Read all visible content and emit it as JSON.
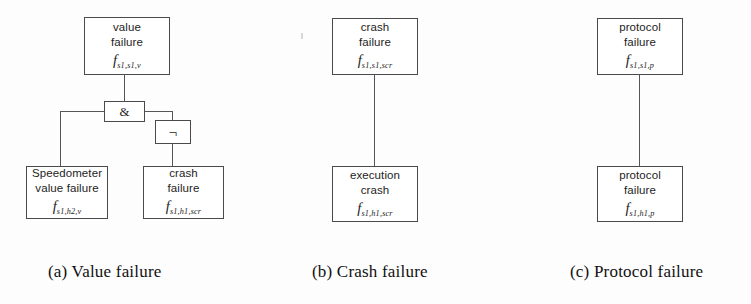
{
  "figure": {
    "kind": "fault-tree-diagram",
    "panel_count": 3,
    "colors": {
      "background": "#fdfdfd",
      "box_border": "#4a4a4a",
      "edge": "#55555a",
      "text": "#1d1d1d",
      "caption_text": "#111111"
    }
  },
  "panels": [
    {
      "id": "a",
      "caption": "(a) Value failure",
      "nodes": {
        "top": {
          "line1": "value",
          "line2": "failure",
          "math_symbol": "f",
          "math_subscript": "s1,s1,v"
        },
        "left_leaf": {
          "line1": "Speedometer",
          "line2": "value failure",
          "math_symbol": "f",
          "math_subscript": "s1,h2,v"
        },
        "right_leaf": {
          "line1": "crash",
          "line2": "failure",
          "math_symbol": "f",
          "math_subscript": "s1,h1,scr"
        }
      },
      "gates": {
        "and": {
          "label": "&",
          "type": "and-gate"
        },
        "not": {
          "label": "¬",
          "type": "not-gate"
        }
      }
    },
    {
      "id": "b",
      "caption": "(b) Crash failure",
      "nodes": {
        "top": {
          "line1": "crash",
          "line2": "failure",
          "math_symbol": "f",
          "math_subscript": "s1,s1,scr"
        },
        "bottom": {
          "line1": "execution",
          "line2": "crash",
          "math_symbol": "f",
          "math_subscript": "s1,h1,scr"
        }
      }
    },
    {
      "id": "c",
      "caption": "(c) Protocol failure",
      "nodes": {
        "top": {
          "line1": "protocol",
          "line2": "failure",
          "math_symbol": "f",
          "math_subscript": "s1,s1,p"
        },
        "bottom": {
          "line1": "protocol",
          "line2": "failure",
          "math_symbol": "f",
          "math_subscript": "s1,h1,p"
        }
      }
    }
  ]
}
